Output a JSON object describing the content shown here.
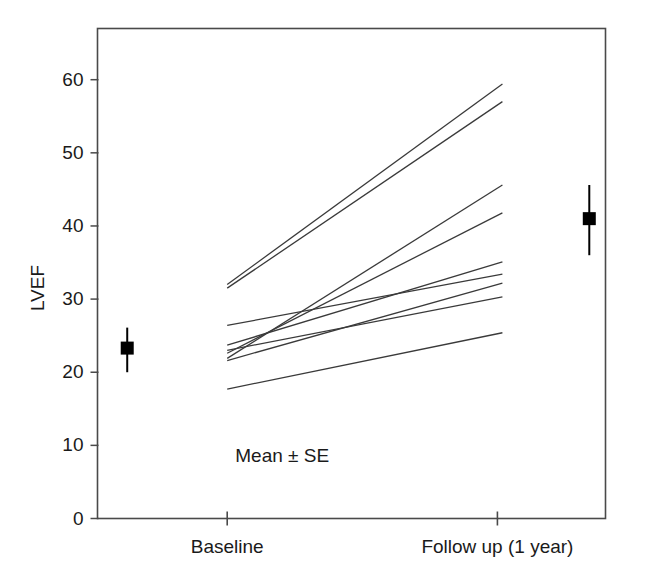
{
  "chart_data": {
    "type": "line",
    "title": "",
    "subtitle": "",
    "xlabel": "",
    "ylabel": "LVEF",
    "categories": [
      "Baseline",
      "Follow up (1 year)"
    ],
    "x": [
      0,
      1
    ],
    "xlim": [
      -0.48,
      1.4
    ],
    "ylim": [
      0,
      67
    ],
    "yticks": [
      0,
      10,
      20,
      30,
      40,
      50,
      60
    ],
    "ytick_labels": [
      "0",
      "10",
      "20",
      "30",
      "40",
      "50",
      "60"
    ],
    "xtick_labels": [
      "Baseline",
      "Follow up (1 year)"
    ],
    "grid": false,
    "legend": null,
    "annotations": [
      {
        "name": "mean-se-note",
        "text": "Mean ± SE",
        "x": 0.03,
        "y": 8.5
      }
    ],
    "series": [
      {
        "name": "patient-1",
        "kind": "individual-line",
        "values": [
          32.0,
          59.4
        ]
      },
      {
        "name": "patient-2",
        "kind": "individual-line",
        "values": [
          31.5,
          57.0
        ]
      },
      {
        "name": "patient-3",
        "kind": "individual-line",
        "values": [
          21.9,
          45.6
        ]
      },
      {
        "name": "patient-4",
        "kind": "individual-line",
        "values": [
          22.6,
          41.8
        ]
      },
      {
        "name": "patient-5",
        "kind": "individual-line",
        "values": [
          23.7,
          35.1
        ]
      },
      {
        "name": "patient-6",
        "kind": "individual-line",
        "values": [
          26.4,
          33.4
        ]
      },
      {
        "name": "patient-7",
        "kind": "individual-line",
        "values": [
          21.6,
          32.2
        ]
      },
      {
        "name": "patient-8",
        "kind": "individual-line",
        "values": [
          23.0,
          30.3
        ]
      },
      {
        "name": "patient-9",
        "kind": "individual-line",
        "values": [
          17.7,
          25.4
        ]
      }
    ],
    "mean_points": [
      {
        "name": "baseline-mean",
        "category": "Baseline",
        "x": -0.37,
        "mean": 23.3,
        "se_upper": 26.1,
        "se_lower": 20.0
      },
      {
        "name": "followup-mean",
        "category": "Follow up (1 year)",
        "x": 1.34,
        "mean": 41.0,
        "se_upper": 45.6,
        "se_lower": 36.0
      }
    ],
    "colors": {
      "line": "#3a3a3a",
      "axis": "#4a4a4a",
      "marker": "#000000",
      "text": "#1a1a1a",
      "background": "#ffffff"
    }
  }
}
